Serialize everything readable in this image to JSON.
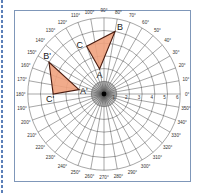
{
  "diagram": {
    "type": "polar-grid",
    "center": [
      104,
      94
    ],
    "unit_px": 12.7,
    "rings": [
      1,
      2,
      3,
      4,
      5,
      6
    ],
    "radius_labels": [
      "1",
      "2",
      "3",
      "4",
      "5",
      "6"
    ],
    "angle_step_deg": 10,
    "angle_labels": [
      "0°",
      "10°",
      "20°",
      "30°",
      "40°",
      "50°",
      "60°",
      "70°",
      "80°",
      "90°",
      "100°",
      "110°",
      "120°",
      "130°",
      "140°",
      "150°",
      "160°",
      "170°",
      "180°",
      "190°",
      "200°",
      "210°",
      "220°",
      "230°",
      "240°",
      "250°",
      "260°",
      "270°",
      "280°",
      "290°",
      "300°",
      "310°",
      "320°",
      "330°",
      "340°",
      "350°"
    ],
    "colors": {
      "triangle_fill": "#f0a27e",
      "triangle_stroke": "#4a1c10",
      "frame_border": "#7f97b9",
      "grid": "#3a3a3a"
    },
    "triangles": [
      {
        "name": "ABC",
        "vertices": [
          {
            "label": "A",
            "r": 2,
            "theta": 100
          },
          {
            "label": "B",
            "r": 5,
            "theta": 80
          },
          {
            "label": "C",
            "r": 4,
            "theta": 110
          }
        ]
      },
      {
        "name": "A'B'C'",
        "vertices": [
          {
            "label": "A'",
            "r": 2,
            "theta": 170
          },
          {
            "label": "B'",
            "r": 5,
            "theta": 150
          },
          {
            "label": "C'",
            "r": 4,
            "theta": 180
          }
        ]
      }
    ]
  }
}
